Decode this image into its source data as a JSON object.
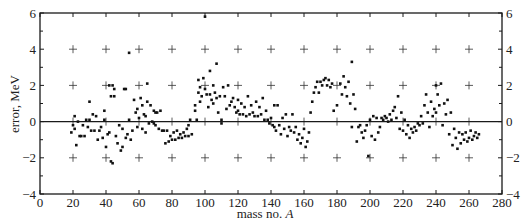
{
  "chart_data": {
    "type": "scatter",
    "title": "",
    "xlabel": "mass no. A",
    "xlabel_plain": "mass no. ",
    "xlabel_italic": "A",
    "ylabel": "error, MeV",
    "xlim": [
      0,
      280
    ],
    "ylim": [
      -4,
      6
    ],
    "xticks": [
      0,
      20,
      40,
      60,
      80,
      100,
      120,
      140,
      160,
      180,
      200,
      220,
      240,
      260,
      280
    ],
    "yticks": [
      -4,
      -2,
      0,
      2,
      4,
      6
    ],
    "ytick_labels": [
      "−4",
      "−2",
      "0",
      "2",
      "4",
      "6"
    ],
    "right_axis_labels": true,
    "grid": "plus-markers at every 20 in A and every 2 MeV",
    "zero_line": true,
    "legend": null,
    "series": [
      {
        "name": "errors",
        "points": [
          [
            19,
            -0.6
          ],
          [
            20,
            -0.2
          ],
          [
            21,
            -0.4
          ],
          [
            21,
            0.3
          ],
          [
            22,
            -1.3
          ],
          [
            23,
            0.0
          ],
          [
            24,
            -0.8
          ],
          [
            25,
            -0.8
          ],
          [
            26,
            -0.2
          ],
          [
            27,
            -0.8
          ],
          [
            28,
            0.1
          ],
          [
            29,
            -0.3
          ],
          [
            30,
            0.1
          ],
          [
            30,
            1.1
          ],
          [
            31,
            -0.5
          ],
          [
            32,
            0.4
          ],
          [
            33,
            -0.5
          ],
          [
            34,
            0.3
          ],
          [
            35,
            -1.0
          ],
          [
            36,
            -0.5
          ],
          [
            37,
            -0.3
          ],
          [
            38,
            -0.9
          ],
          [
            39,
            0.6
          ],
          [
            39,
            0.1
          ],
          [
            40,
            -1.4
          ],
          [
            41,
            -0.7
          ],
          [
            42,
            -0.6
          ],
          [
            42,
            2.0
          ],
          [
            43,
            1.4
          ],
          [
            43,
            -2.2
          ],
          [
            44,
            2.0
          ],
          [
            44,
            -2.3
          ],
          [
            45,
            1.8
          ],
          [
            45,
            1.4
          ],
          [
            46,
            -0.8
          ],
          [
            47,
            -1.2
          ],
          [
            48,
            -0.2
          ],
          [
            49,
            -1.6
          ],
          [
            50,
            -0.4
          ],
          [
            50,
            -1.4
          ],
          [
            51,
            1.8
          ],
          [
            52,
            1.8
          ],
          [
            52,
            -0.9
          ],
          [
            53,
            -0.7
          ],
          [
            54,
            3.8
          ],
          [
            54,
            0.1
          ],
          [
            55,
            -1.0
          ],
          [
            56,
            -0.5
          ],
          [
            57,
            1.2
          ],
          [
            58,
            0.5
          ],
          [
            59,
            -0.3
          ],
          [
            59,
            0.7
          ],
          [
            60,
            0.2
          ],
          [
            61,
            1.3
          ],
          [
            62,
            0.9
          ],
          [
            62,
            -0.4
          ],
          [
            63,
            0.4
          ],
          [
            64,
            -0.6
          ],
          [
            64,
            0.3
          ],
          [
            65,
            2.1
          ],
          [
            65,
            1.1
          ],
          [
            66,
            -0.1
          ],
          [
            67,
            0.9
          ],
          [
            68,
            0.0
          ],
          [
            69,
            -0.1
          ],
          [
            69,
            0.6
          ],
          [
            70,
            0.5
          ],
          [
            70,
            -0.2
          ],
          [
            71,
            0.5
          ],
          [
            72,
            -0.4
          ],
          [
            73,
            0.6
          ],
          [
            74,
            -0.5
          ],
          [
            75,
            -0.5
          ],
          [
            76,
            -1.2
          ],
          [
            77,
            -0.5
          ],
          [
            78,
            -1.1
          ],
          [
            79,
            -0.8
          ],
          [
            80,
            -1.0
          ],
          [
            81,
            -0.6
          ],
          [
            82,
            -1.0
          ],
          [
            83,
            -0.5
          ],
          [
            84,
            -0.9
          ],
          [
            85,
            -0.7
          ],
          [
            86,
            -0.9
          ],
          [
            87,
            -0.6
          ],
          [
            88,
            -0.8
          ],
          [
            89,
            -0.4
          ],
          [
            90,
            -0.2
          ],
          [
            90,
            -0.8
          ],
          [
            91,
            0.1
          ],
          [
            92,
            -0.7
          ],
          [
            94,
            0.9
          ],
          [
            94,
            0.6
          ],
          [
            95,
            0.1
          ],
          [
            96,
            1.6
          ],
          [
            96,
            2.3
          ],
          [
            97,
            1.1
          ],
          [
            97,
            1.9
          ],
          [
            98,
            1.4
          ],
          [
            99,
            2.4
          ],
          [
            100,
            5.8
          ],
          [
            100,
            1.8
          ],
          [
            101,
            1.5
          ],
          [
            102,
            0.8
          ],
          [
            103,
            1.5
          ],
          [
            103,
            2.8
          ],
          [
            104,
            1.2
          ],
          [
            105,
            2.0
          ],
          [
            105,
            1.0
          ],
          [
            106,
            1.6
          ],
          [
            107,
            3.2
          ],
          [
            107,
            1.3
          ],
          [
            108,
            0.5
          ],
          [
            109,
            1.4
          ],
          [
            110,
            0.1
          ],
          [
            110,
            -0.1
          ],
          [
            111,
            1.9
          ],
          [
            112,
            1.4
          ],
          [
            113,
            0.7
          ],
          [
            114,
            2.0
          ],
          [
            115,
            0.9
          ],
          [
            116,
            1.1
          ],
          [
            117,
            1.3
          ],
          [
            118,
            0.8
          ],
          [
            119,
            0.5
          ],
          [
            120,
            1.2
          ],
          [
            120,
            0.6
          ],
          [
            121,
            0.4
          ],
          [
            122,
            1.0
          ],
          [
            123,
            0.4
          ],
          [
            124,
            0.8
          ],
          [
            125,
            0.3
          ],
          [
            126,
            1.4
          ],
          [
            127,
            0.4
          ],
          [
            128,
            0.9
          ],
          [
            129,
            0.5
          ],
          [
            130,
            0.3
          ],
          [
            131,
            1.1
          ],
          [
            132,
            0.3
          ],
          [
            133,
            0.8
          ],
          [
            134,
            0.4
          ],
          [
            135,
            1.3
          ],
          [
            136,
            0.1
          ],
          [
            137,
            0.6
          ],
          [
            138,
            0.1
          ],
          [
            139,
            -0.1
          ],
          [
            140,
            0.2
          ],
          [
            141,
            -0.2
          ],
          [
            142,
            0.9
          ],
          [
            142,
            -0.3
          ],
          [
            143,
            -0.5
          ],
          [
            144,
            0.9
          ],
          [
            145,
            -0.2
          ],
          [
            146,
            -0.7
          ],
          [
            147,
            0.2
          ],
          [
            148,
            -0.4
          ],
          [
            149,
            0.4
          ],
          [
            150,
            -0.8
          ],
          [
            151,
            -0.3
          ],
          [
            152,
            -0.5
          ],
          [
            153,
            0.4
          ],
          [
            154,
            -0.6
          ],
          [
            155,
            -0.3
          ],
          [
            156,
            -1.0
          ],
          [
            157,
            -0.7
          ],
          [
            158,
            -1.2
          ],
          [
            159,
            -0.9
          ],
          [
            160,
            -0.4
          ],
          [
            161,
            -1.4
          ],
          [
            162,
            -1.1
          ],
          [
            163,
            -0.6
          ],
          [
            164,
            0.5
          ],
          [
            165,
            1.1
          ],
          [
            166,
            1.6
          ],
          [
            167,
            1.9
          ],
          [
            168,
            2.2
          ],
          [
            169,
            1.6
          ],
          [
            170,
            2.2
          ],
          [
            171,
            2.0
          ],
          [
            172,
            2.3
          ],
          [
            173,
            2.4
          ],
          [
            174,
            2.0
          ],
          [
            175,
            2.3
          ],
          [
            176,
            1.9
          ],
          [
            177,
            2.1
          ],
          [
            178,
            0.6
          ],
          [
            180,
            0.9
          ],
          [
            182,
            2.1
          ],
          [
            183,
            1.5
          ],
          [
            184,
            2.5
          ],
          [
            185,
            1.9
          ],
          [
            186,
            1.4
          ],
          [
            187,
            2.2
          ],
          [
            188,
            1.0
          ],
          [
            189,
            3.3
          ],
          [
            189,
            -0.3
          ],
          [
            190,
            1.5
          ],
          [
            191,
            0.7
          ],
          [
            192,
            -1.1
          ],
          [
            193,
            -0.3
          ],
          [
            194,
            -0.2
          ],
          [
            195,
            -0.6
          ],
          [
            196,
            -0.9
          ],
          [
            197,
            -0.5
          ],
          [
            198,
            -0.2
          ],
          [
            199,
            -1.9
          ],
          [
            200,
            0.1
          ],
          [
            201,
            -0.8
          ],
          [
            202,
            0.3
          ],
          [
            203,
            -1.0
          ],
          [
            204,
            0.2
          ],
          [
            205,
            -0.6
          ],
          [
            206,
            -0.3
          ],
          [
            207,
            0.2
          ],
          [
            208,
            0.1
          ],
          [
            209,
            0.3
          ],
          [
            210,
            0.2
          ],
          [
            211,
            0.0
          ],
          [
            212,
            0.4
          ],
          [
            213,
            0.1
          ],
          [
            214,
            0.6
          ],
          [
            215,
            0.8
          ],
          [
            216,
            0.2
          ],
          [
            217,
            1.4
          ],
          [
            218,
            -0.4
          ],
          [
            219,
            0.5
          ],
          [
            220,
            -0.5
          ],
          [
            221,
            0.1
          ],
          [
            222,
            -0.7
          ],
          [
            223,
            -0.2
          ],
          [
            224,
            -0.9
          ],
          [
            225,
            -0.4
          ],
          [
            226,
            -0.6
          ],
          [
            227,
            -0.3
          ],
          [
            228,
            -0.5
          ],
          [
            229,
            -0.1
          ],
          [
            230,
            -0.2
          ],
          [
            231,
            0.3
          ],
          [
            232,
            -0.1
          ],
          [
            233,
            0.9
          ],
          [
            234,
            1.5
          ],
          [
            235,
            0.5
          ],
          [
            236,
            -0.3
          ],
          [
            237,
            1.1
          ],
          [
            238,
            0.3
          ],
          [
            239,
            0.7
          ],
          [
            240,
            2.0
          ],
          [
            240,
            0.5
          ],
          [
            241,
            1.5
          ],
          [
            242,
            0.9
          ],
          [
            243,
            2.1
          ],
          [
            244,
            -0.2
          ],
          [
            245,
            1.0
          ],
          [
            246,
            0.4
          ],
          [
            247,
            1.2
          ],
          [
            248,
            -0.7
          ],
          [
            249,
            0.5
          ],
          [
            250,
            -1.3
          ],
          [
            251,
            -0.4
          ],
          [
            252,
            -0.9
          ],
          [
            253,
            -1.5
          ],
          [
            254,
            -0.6
          ],
          [
            255,
            -1.2
          ],
          [
            256,
            -0.7
          ],
          [
            257,
            -1.0
          ],
          [
            258,
            -0.6
          ],
          [
            259,
            -1.1
          ],
          [
            260,
            -0.9
          ],
          [
            261,
            -0.5
          ],
          [
            262,
            -1.0
          ],
          [
            263,
            -0.8
          ],
          [
            264,
            -0.6
          ],
          [
            265,
            -0.9
          ],
          [
            266,
            -0.7
          ]
        ]
      }
    ]
  }
}
